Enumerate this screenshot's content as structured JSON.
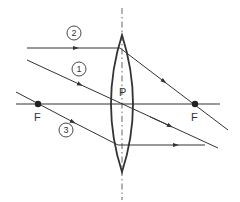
{
  "diagram": {
    "type": "convex-lens-ray-diagram",
    "colors": {
      "stroke": "#333333",
      "background": "#ffffff"
    },
    "labels": {
      "optical_center": "P",
      "focus_left": "F",
      "focus_right": "F"
    },
    "rays": [
      {
        "id": "1",
        "label": "1",
        "description": "Ray through optical center passes undeviated"
      },
      {
        "id": "2",
        "label": "2",
        "description": "Ray parallel to principal axis refracts through focus"
      },
      {
        "id": "3",
        "label": "3",
        "description": "Ray through focus emerges parallel to principal axis"
      }
    ]
  }
}
